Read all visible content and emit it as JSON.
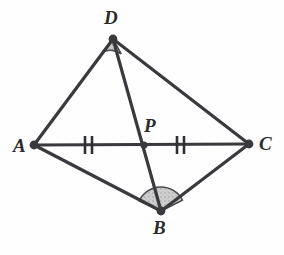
{
  "figure": {
    "canvas": {
      "width": 284,
      "height": 255,
      "background": "#fefefe"
    },
    "style": {
      "stroke_color": "#3a3a3e",
      "stroke_width": 3.2,
      "vertex_dot_color": "#3a3a3e",
      "vertex_dot_radius": 4.2,
      "intersection_dot_radius": 3.4,
      "arc_fill": "#c9c9c9",
      "arc_stroke": "#4a4a4e",
      "tick_color": "#2f2f33",
      "label_color": "#2b2b2b"
    },
    "points": [
      {
        "id": "D",
        "label": "D",
        "x": 113,
        "y": 39,
        "label_x": 104,
        "label_y": 8,
        "dot": true
      },
      {
        "id": "A",
        "label": "A",
        "x": 34,
        "y": 145,
        "label_x": 13,
        "label_y": 136,
        "dot": true
      },
      {
        "id": "C",
        "label": "C",
        "x": 249,
        "y": 144,
        "label_x": 259,
        "label_y": 134,
        "dot": true
      },
      {
        "id": "B",
        "label": "B",
        "x": 161,
        "y": 211,
        "label_x": 153,
        "label_y": 218,
        "dot": true
      },
      {
        "id": "P",
        "label": "P",
        "x": 144,
        "y": 145,
        "label_x": 144,
        "label_y": 116,
        "dot": true
      }
    ],
    "segments": [
      {
        "id": "AD",
        "from": "A",
        "to": "D"
      },
      {
        "id": "DC",
        "from": "D",
        "to": "C"
      },
      {
        "id": "AB",
        "from": "A",
        "to": "B"
      },
      {
        "id": "BC",
        "from": "B",
        "to": "C"
      },
      {
        "id": "AC",
        "from": "A",
        "to": "C",
        "note": "diagonal through P"
      },
      {
        "id": "DB",
        "from": "D",
        "to": "B",
        "note": "diagonal through P"
      }
    ],
    "tick_marks": [
      {
        "id": "tick-AP",
        "on_segment": "AP",
        "x": 88,
        "y": 145,
        "count": 2,
        "label": "congruent-AP"
      },
      {
        "id": "tick-PC",
        "on_segment": "PC",
        "x": 180,
        "y": 145,
        "count": 2,
        "label": "congruent-PC"
      }
    ],
    "angle_arcs": [
      {
        "id": "angle-D",
        "at_vertex": "D",
        "shaded": true,
        "radius": 17,
        "start_deg": 128,
        "end_deg": 61,
        "label": "angle-ADC-shaded"
      },
      {
        "id": "angle-B",
        "at_vertex": "B",
        "shaded": true,
        "radius": 24,
        "start_deg": 205,
        "end_deg": 333,
        "label": "angle-ABC-shaded"
      }
    ],
    "caption": ""
  }
}
